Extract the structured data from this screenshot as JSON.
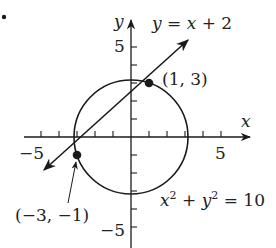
{
  "diagram": {
    "bullet": "•",
    "axes": {
      "x_label": "x",
      "y_label": "y",
      "x_ticks": {
        "neg": "−5",
        "pos": "5"
      },
      "y_ticks": {
        "pos": "5",
        "neg": "−5"
      }
    },
    "line": {
      "equation": {
        "lhs": "y",
        "eq": " = ",
        "x": "x",
        "rest": " + 2"
      },
      "slope": 1,
      "intercept": 2
    },
    "circle": {
      "equation": {
        "x": "x",
        "sq1": "2",
        "plus": " + ",
        "y": "y",
        "sq2": "2",
        "rhs": " = 10"
      },
      "radius_squared": 10
    },
    "points": [
      {
        "label": "(1, 3)",
        "x": 1,
        "y": 3
      },
      {
        "label": "(−3, −1)",
        "x": -3,
        "y": -1
      }
    ],
    "colors": {
      "stroke": "#1a1a1a"
    }
  }
}
